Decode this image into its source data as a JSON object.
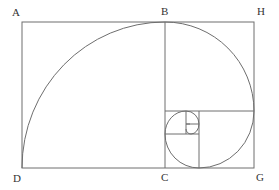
{
  "diagram": {
    "stroke_color": "#6e6e6e",
    "label_color": "#333333",
    "points": {
      "A": {
        "label": "A",
        "x": 22,
        "y": 22
      },
      "B": {
        "label": "B",
        "x": 165,
        "y": 22
      },
      "H": {
        "label": "H",
        "x": 254,
        "y": 22
      },
      "D": {
        "label": "D",
        "x": 22,
        "y": 168
      },
      "C": {
        "label": "C",
        "x": 165,
        "y": 168
      },
      "G": {
        "label": "G",
        "x": 254,
        "y": 168
      }
    },
    "labels": {
      "A": "A",
      "B": "B",
      "H": "H",
      "D": "D",
      "C": "C",
      "G": "G"
    }
  }
}
